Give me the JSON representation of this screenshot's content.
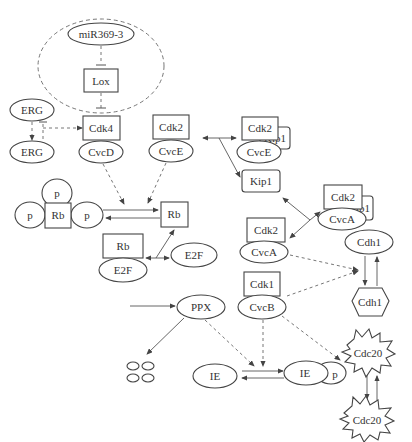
{
  "diagram": {
    "type": "cell-cycle signaling network",
    "nodes": {
      "mir": "miR369-3",
      "lox": "Lox",
      "erg1": "ERG",
      "erg2": "ERG",
      "cdk4": "Cdk4",
      "cycd": "CvcD",
      "cdk2_e": "Cdk2",
      "cyce": "CvcE",
      "cdk2_ek": "Cdk2",
      "cyce_k": "CvcE",
      "kip1_e": "Kip1",
      "kip1": "Kip1",
      "cdk2_ak": "Cdk2",
      "cyca_k": "CvcA",
      "kip1_a": "Kip1",
      "p_top": "p",
      "p_left": "p",
      "rb_p": "Rb",
      "p_right": "p",
      "rb": "Rb",
      "rb_e2f": "Rb",
      "e2f_c": "E2F",
      "e2f": "E2F",
      "cdk2_a": "Cdk2",
      "cyca": "CvcA",
      "cdh1_e": "Cdh1",
      "cdh1_h": "Cdh1",
      "cdk1": "Cdk1",
      "cycb": "CvcB",
      "ppx": "PPX",
      "ie": "IE",
      "ie_p": "IE",
      "p_ie": "p",
      "cdc20_a": "Cdc20",
      "cdc20_b": "Cdc20"
    },
    "edges": [
      {
        "from": "miR369-3",
        "to": "Lox",
        "style": "dashed",
        "type": "inhibition"
      },
      {
        "from": "Lox",
        "to": "Cdk4",
        "style": "dashed",
        "type": "inhibition"
      },
      {
        "from": "ERG",
        "to": "ERG",
        "style": "dashed",
        "type": "activation"
      },
      {
        "from": "ERG",
        "to": "ERG",
        "style": "dashed",
        "type": "inhibition"
      },
      {
        "from": "ERG",
        "to": "Cdk4",
        "style": "dashed",
        "type": "activation"
      },
      {
        "from": "CvcD",
        "to": "Rb transition",
        "style": "dashed",
        "type": "activation"
      },
      {
        "from": "CvcE",
        "to": "Rb transition",
        "style": "dashed",
        "type": "activation"
      },
      {
        "from": "p-Rb",
        "to": "Rb",
        "style": "solid",
        "type": "reversible"
      },
      {
        "from": "Rb/E2F",
        "to": "E2F",
        "style": "solid",
        "type": "reversible"
      },
      {
        "from": "Cdk2/CvcE",
        "to": "Cdk2/CvcE/Kip1",
        "style": "solid",
        "type": "reversible"
      },
      {
        "from": "Cdk2/CvcA",
        "to": "Cdk2/CvcA/Kip1",
        "style": "solid",
        "type": "reversible"
      },
      {
        "from": "Cdk2/CvcA",
        "to": "Cdh1 transition",
        "style": "dashed",
        "type": "activation"
      },
      {
        "from": "CvcB",
        "to": "Cdh1 transition",
        "style": "dashed",
        "type": "activation"
      },
      {
        "from": "Cdh1",
        "to": "Cdh1",
        "style": "solid",
        "type": "reversible"
      },
      {
        "from": "CvcB",
        "to": "Cdc20",
        "style": "dashed",
        "type": "activation"
      },
      {
        "from": "CvcB",
        "to": "IE transition",
        "style": "dashed",
        "type": "activation"
      },
      {
        "from": "PPX",
        "to": "IE transition",
        "style": "dashed",
        "type": "activation"
      },
      {
        "from": "PPX",
        "to": "degradation",
        "style": "solid",
        "type": "activation"
      },
      {
        "from": "IE",
        "to": "IE-p",
        "style": "solid",
        "type": "reversible"
      },
      {
        "from": "Cdc20",
        "to": "Cdc20",
        "style": "solid",
        "type": "reversible"
      }
    ]
  }
}
